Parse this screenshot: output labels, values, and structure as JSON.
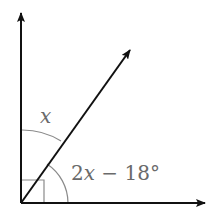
{
  "diagram": {
    "type": "angle-diagram",
    "colors": {
      "lines": "#111111",
      "arcs": "#8a8a8a",
      "labels": "#6a6a6a",
      "background": "#ffffff"
    },
    "origin": {
      "x": 21,
      "y": 203
    },
    "rays": [
      {
        "name": "vertical-ray",
        "to": {
          "x": 21,
          "y": 12
        }
      },
      {
        "name": "horizontal-ray",
        "to": {
          "x": 206,
          "y": 203
        }
      },
      {
        "name": "diagonal-ray",
        "to": {
          "x": 131,
          "y": 49
        }
      }
    ],
    "right_angle_marker": {
      "size": 23
    },
    "angles": [
      {
        "name": "upper-angle",
        "label": "x",
        "between": [
          "vertical-ray",
          "diagonal-ray"
        ],
        "arc_radius": 73
      },
      {
        "name": "lower-angle",
        "label": "2x − 18°",
        "between": [
          "diagonal-ray",
          "horizontal-ray"
        ],
        "arc_radius": 47
      }
    ],
    "labels": {
      "upper": "x",
      "lower_coef": "2",
      "lower_var": "x",
      "lower_rest": " − 18°"
    }
  }
}
